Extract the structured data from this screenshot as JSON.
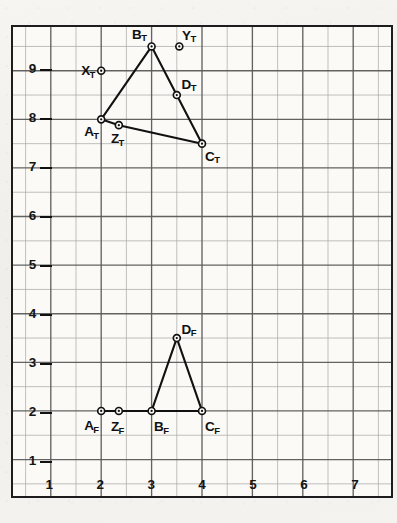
{
  "figure": {
    "background_color": "#f3f2ef",
    "paper_color": "#fbfaf7",
    "frame_color": "#1d1d1d",
    "major_grid_color": "#5a5a5a",
    "minor_grid_color": "#a8a8a8",
    "ink_color": "#111111"
  },
  "chart_data": {
    "type": "scatter",
    "title": "",
    "subtitle": "",
    "xlabel": "",
    "ylabel": "",
    "xlim": [
      0.25,
      7.75
    ],
    "ylim": [
      0.25,
      9.9
    ],
    "xticks": [
      1,
      2,
      3,
      4,
      5,
      6,
      7
    ],
    "xticklabels": [
      "1",
      "2",
      "3",
      "4",
      "5",
      "6",
      "7"
    ],
    "yticks": [
      1,
      2,
      3,
      4,
      5,
      6,
      7,
      8,
      9
    ],
    "yticklabels": [
      "1",
      "2",
      "3",
      "4",
      "5",
      "6",
      "7",
      "8",
      "9"
    ],
    "grid": true,
    "grid_major_step": 1,
    "grid_minor_step": 0.5,
    "legend": false,
    "legend_position": "none",
    "marker": "circle-with-center-dot",
    "points": [
      {
        "id": "A_T",
        "label": "A",
        "sub": "T",
        "x": 2.0,
        "y": 8.0,
        "label_dx": -16,
        "label_dy": 7
      },
      {
        "id": "B_T",
        "label": "B",
        "sub": "T",
        "x": 3.0,
        "y": 9.5,
        "label_dx": -19,
        "label_dy": -17
      },
      {
        "id": "C_T",
        "label": "C",
        "sub": "T",
        "x": 4.0,
        "y": 7.5,
        "label_dx": 3,
        "label_dy": 7
      },
      {
        "id": "D_T",
        "label": "D",
        "sub": "T",
        "x": 3.5,
        "y": 8.5,
        "label_dx": 5,
        "label_dy": -16
      },
      {
        "id": "X_T",
        "label": "X",
        "sub": "T",
        "x": 2.0,
        "y": 9.0,
        "label_dx": -19,
        "label_dy": -5
      },
      {
        "id": "Y_T",
        "label": "Y",
        "sub": "T",
        "x": 3.55,
        "y": 9.5,
        "label_dx": 3,
        "label_dy": -16
      },
      {
        "id": "Z_T",
        "label": "Z",
        "sub": "T",
        "x": 2.35,
        "y": 7.88,
        "label_dx": -7,
        "label_dy": 8
      },
      {
        "id": "A_F",
        "label": "A",
        "sub": "F",
        "x": 2.0,
        "y": 2.0,
        "label_dx": -16,
        "label_dy": 7
      },
      {
        "id": "Z_F",
        "label": "Z",
        "sub": "F",
        "x": 2.35,
        "y": 2.0,
        "label_dx": -7,
        "label_dy": 8
      },
      {
        "id": "B_F",
        "label": "B",
        "sub": "F",
        "x": 3.0,
        "y": 2.0,
        "label_dx": 3,
        "label_dy": 8
      },
      {
        "id": "C_F",
        "label": "C",
        "sub": "F",
        "x": 4.0,
        "y": 2.0,
        "label_dx": 3,
        "label_dy": 8
      },
      {
        "id": "D_F",
        "label": "D",
        "sub": "F",
        "x": 3.5,
        "y": 3.5,
        "label_dx": 5,
        "label_dy": -16
      }
    ],
    "polylines": [
      {
        "name": "top-triangle-ABC",
        "point_ids": [
          "A_T",
          "B_T",
          "C_T"
        ],
        "closed": false
      },
      {
        "name": "top-edge-A-Z-C",
        "point_ids": [
          "A_T",
          "Z_T",
          "C_T"
        ],
        "closed": false
      },
      {
        "name": "front-base-A-Z-B-C",
        "point_ids": [
          "A_F",
          "Z_F",
          "B_F",
          "C_F"
        ],
        "closed": false
      },
      {
        "name": "front-triangle-B-D-C",
        "point_ids": [
          "B_F",
          "D_F",
          "C_F"
        ],
        "closed": false
      }
    ]
  }
}
